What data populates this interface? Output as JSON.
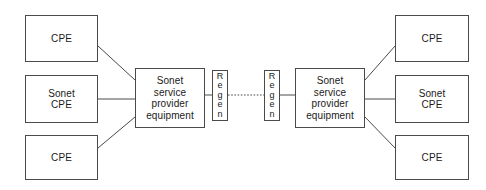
{
  "diagram": {
    "canvas": {
      "width": 486,
      "height": 190,
      "background": "#ffffff"
    },
    "style": {
      "box_stroke": "#4a4a4a",
      "box_fill": "#ffffff",
      "link_stroke": "#4a4a4a",
      "text_color": "#1a1a1a"
    },
    "nodes": [
      {
        "id": "cpe-left-top",
        "label": "CPE",
        "x": 25,
        "y": 15,
        "w": 73,
        "h": 47,
        "orientation": "horizontal"
      },
      {
        "id": "sonet-cpe-left",
        "label": "Sonet\nCPE",
        "x": 25,
        "y": 75,
        "w": 73,
        "h": 48,
        "orientation": "horizontal"
      },
      {
        "id": "cpe-left-bottom",
        "label": "CPE",
        "x": 25,
        "y": 135,
        "w": 73,
        "h": 45,
        "orientation": "horizontal"
      },
      {
        "id": "sonet-equipment-left",
        "label": "Sonet\nservice\nprovider\nequipment",
        "x": 135,
        "y": 68,
        "w": 70,
        "h": 60,
        "orientation": "horizontal"
      },
      {
        "id": "regen-left",
        "label": "R\ne\ng\ne\nn",
        "x": 212,
        "y": 70,
        "w": 16,
        "h": 51,
        "orientation": "vertical"
      },
      {
        "id": "regen-right",
        "label": "R\ne\ng\ne\nn",
        "x": 264,
        "y": 70,
        "w": 16,
        "h": 51,
        "orientation": "vertical"
      },
      {
        "id": "sonet-equipment-right",
        "label": "Sonet\nservice\nprovider\nequipment",
        "x": 295,
        "y": 68,
        "w": 70,
        "h": 60,
        "orientation": "horizontal"
      },
      {
        "id": "cpe-right-top",
        "label": "CPE",
        "x": 395,
        "y": 15,
        "w": 74,
        "h": 47,
        "orientation": "horizontal"
      },
      {
        "id": "sonet-cpe-right",
        "label": "Sonet\nCPE",
        "x": 395,
        "y": 75,
        "w": 74,
        "h": 48,
        "orientation": "horizontal"
      },
      {
        "id": "cpe-right-bottom",
        "label": "CPE",
        "x": 395,
        "y": 135,
        "w": 74,
        "h": 45,
        "orientation": "horizontal"
      }
    ],
    "links": [
      {
        "id": "link-cpe-left-top",
        "from": "cpe-left-top",
        "to": "sonet-equipment-left",
        "style": "solid",
        "points": "98,46 135,80"
      },
      {
        "id": "link-sonet-cpe-left",
        "from": "sonet-cpe-left",
        "to": "sonet-equipment-left",
        "style": "solid",
        "points": "98,99 135,99"
      },
      {
        "id": "link-cpe-left-bottom",
        "from": "cpe-left-bottom",
        "to": "sonet-equipment-left",
        "style": "solid",
        "points": "98,148 135,117"
      },
      {
        "id": "link-equipment-left-regen-left",
        "from": "sonet-equipment-left",
        "to": "regen-left",
        "style": "solid",
        "points": "205,95 212,95"
      },
      {
        "id": "link-regen-to-regen",
        "from": "regen-left",
        "to": "regen-right",
        "style": "dotted",
        "points": "228,95 264,95"
      },
      {
        "id": "link-regen-right-equipment-right",
        "from": "regen-right",
        "to": "sonet-equipment-right",
        "style": "solid",
        "points": "280,95 295,95"
      },
      {
        "id": "link-cpe-right-top",
        "from": "sonet-equipment-right",
        "to": "cpe-right-top",
        "style": "solid",
        "points": "365,80 395,46"
      },
      {
        "id": "link-sonet-cpe-right",
        "from": "sonet-equipment-right",
        "to": "sonet-cpe-right",
        "style": "solid",
        "points": "365,99 395,99"
      },
      {
        "id": "link-cpe-right-bottom",
        "from": "sonet-equipment-right",
        "to": "cpe-right-bottom",
        "style": "solid",
        "points": "365,117 395,148"
      }
    ]
  }
}
